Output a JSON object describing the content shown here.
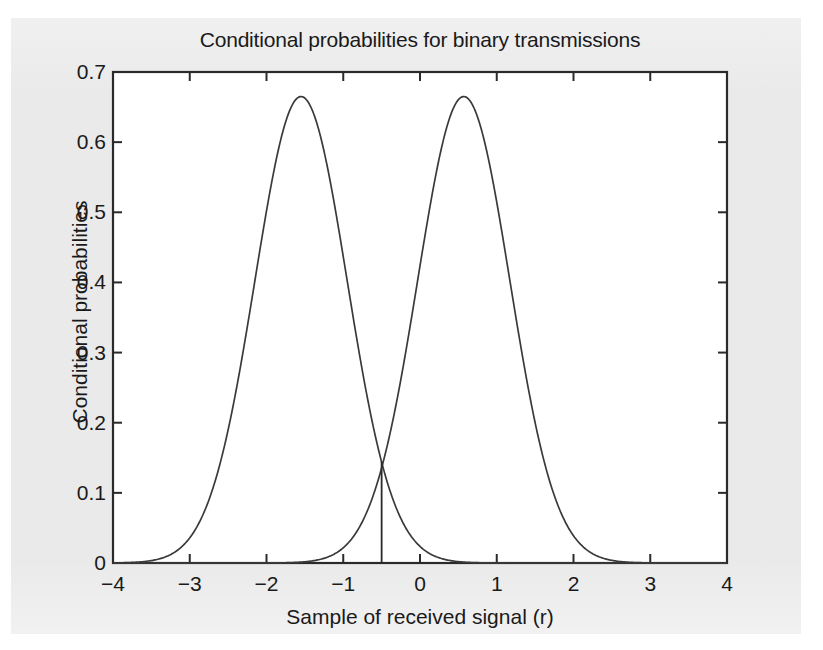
{
  "figure": {
    "background_color": "#eaeaea",
    "plot_background_color": "#ffffff",
    "axis_color": "#2a2a2a",
    "curve_color": "#3a3a3a"
  },
  "chart_data": {
    "type": "line",
    "title": "Conditional probabilities for binary transmissions",
    "xlabel": "Sample of received signal (r)",
    "ylabel": "Conditional probabilities",
    "xlim": [
      -4,
      4
    ],
    "ylim": [
      0,
      0.7
    ],
    "grid": false,
    "legend_position": "inline-annotations",
    "xticks": [
      -4,
      -3,
      -2,
      -1,
      0,
      1,
      2,
      3,
      4
    ],
    "xticklabels": [
      "−4",
      "−3",
      "−2",
      "−1",
      "0",
      "1",
      "2",
      "3",
      "4"
    ],
    "yticks": [
      0,
      0.1,
      0.2,
      0.3,
      0.4,
      0.5,
      0.6,
      0.7
    ],
    "yticklabels": [
      "0",
      "0.1",
      "0.2",
      "0.3",
      "0.4",
      "0.5",
      "0.6",
      "0.7"
    ],
    "series": [
      {
        "name": "p(V|0)",
        "label": "p(V|0)",
        "distribution": "gaussian",
        "mean": -1.55,
        "sigma": 0.6,
        "peak_value": 0.665,
        "label_x": -2.45,
        "label_y": 0.605,
        "x": [
          -4.0,
          -3.75,
          -3.5,
          -3.25,
          -3.0,
          -2.75,
          -2.5,
          -2.25,
          -2.0,
          -1.75,
          -1.55,
          -1.35,
          -1.1,
          -0.85,
          -0.6,
          -0.5,
          -0.35,
          -0.1,
          0.15,
          0.4,
          0.65,
          0.9,
          1.15,
          1.4,
          1.65,
          1.9,
          2.2,
          2.6,
          3.0,
          3.5,
          4.0
        ],
        "y": [
          0.0002,
          0.0009,
          0.0034,
          0.0109,
          0.0298,
          0.0697,
          0.1395,
          0.2387,
          0.3499,
          0.4389,
          0.665,
          0.6394,
          0.4786,
          0.3098,
          0.1723,
          0.145,
          0.082,
          0.0336,
          0.0118,
          0.0035,
          0.0009,
          0.0002,
          0.0,
          0.0,
          0.0,
          0.0,
          0.0,
          0.0,
          0.0,
          0.0,
          0.0
        ]
      },
      {
        "name": "p(V|1)",
        "label": "p(V|1)",
        "distribution": "gaussian",
        "mean": 0.57,
        "sigma": 0.6,
        "peak_value": 0.665,
        "label_x": 1.1,
        "label_y": 0.605,
        "x": [
          -4.0,
          -3.5,
          -3.0,
          -2.6,
          -2.2,
          -1.9,
          -1.65,
          -1.4,
          -1.15,
          -0.9,
          -0.65,
          -0.5,
          -0.4,
          -0.15,
          0.1,
          0.35,
          0.57,
          0.8,
          1.05,
          1.3,
          1.55,
          1.8,
          2.05,
          2.3,
          2.6,
          3.0,
          3.5,
          4.0
        ],
        "y": [
          0.0,
          0.0,
          0.0,
          0.0,
          0.0,
          0.0002,
          0.0009,
          0.0035,
          0.0118,
          0.0336,
          0.082,
          0.145,
          0.1723,
          0.3098,
          0.4786,
          0.6394,
          0.665,
          0.6394,
          0.4786,
          0.3098,
          0.1723,
          0.082,
          0.0336,
          0.0118,
          0.0035,
          0.0009,
          0.0002,
          0.0
        ]
      }
    ],
    "annotations": [
      {
        "name": "threshold",
        "label": "V",
        "sublabel": "t",
        "x": -0.5,
        "y_top": 0.145,
        "y_bottom": 0,
        "label_x": -0.33,
        "label_y": 0.055,
        "type": "vertical-line"
      }
    ]
  }
}
